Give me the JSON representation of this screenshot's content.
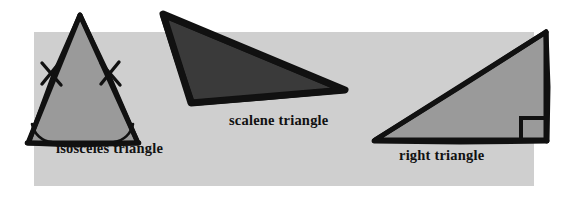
{
  "figure": {
    "width": 572,
    "height": 203,
    "background_color": "#ffffff",
    "panel_color": "#cfcfcf",
    "outline_color": "#000000"
  },
  "labels": {
    "isosceles": "isosceles triangle",
    "scalene": "scalene triangle",
    "right": "right triangle"
  },
  "shapes": {
    "isosceles": {
      "name": "isosceles triangle",
      "fill_color": "#9a9a9a",
      "outline_color": "#111111",
      "vertices": [
        [
          80,
          14
        ],
        [
          26,
          144
        ],
        [
          140,
          144
        ]
      ],
      "markings": {
        "congruent_side_ticks": 2,
        "base_angle_arcs": 2
      }
    },
    "scalene": {
      "name": "scalene triangle",
      "fill_color": "#3a3a3a",
      "outline_color": "#111111",
      "vertices": [
        [
          163,
          14
        ],
        [
          345,
          90
        ],
        [
          192,
          104
        ]
      ],
      "markings": {
        "congruent_side_ticks": 0,
        "angle_arcs": 0
      }
    },
    "right": {
      "name": "right triangle",
      "fill_color": "#9a9a9a",
      "outline_color": "#111111",
      "vertices": [
        [
          546,
          31
        ],
        [
          374,
          141
        ],
        [
          546,
          141
        ]
      ],
      "markings": {
        "right_angle_square": true,
        "right_angle_vertex": [
          546,
          141
        ]
      }
    }
  }
}
